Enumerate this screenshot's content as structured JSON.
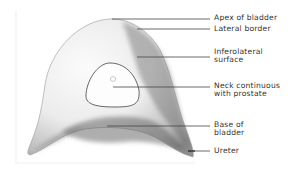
{
  "figure": {
    "labels": [
      {
        "id": "apex",
        "lines": [
          "Apex of bladder"
        ],
        "y": 14,
        "line_y": 19,
        "line_x1": 112
      },
      {
        "id": "lateral-border",
        "lines": [
          "Lateral border"
        ],
        "y": 25,
        "line_y": 29,
        "line_x1": 137
      },
      {
        "id": "inferolateral-surface",
        "lines": [
          "Inferolateral",
          "surface"
        ],
        "y": 48,
        "line_y": 57,
        "line_x1": 137
      },
      {
        "id": "neck",
        "lines": [
          "Neck continuous",
          "with prostate"
        ],
        "y": 83,
        "line_y": 87,
        "line_x1": 113
      },
      {
        "id": "base",
        "lines": [
          "Base of",
          "bladder"
        ],
        "y": 122,
        "line_y": 126,
        "line_x1": 107
      },
      {
        "id": "ureter",
        "lines": [
          "Ureter"
        ],
        "y": 147,
        "line_y": 151,
        "line_x1": 188
      }
    ],
    "colors": {
      "background": "#ffffff",
      "outline": "#9a9a9a",
      "shade_dark": "#6f6f6f",
      "leader_line": "#444444",
      "text": "#333333"
    }
  }
}
